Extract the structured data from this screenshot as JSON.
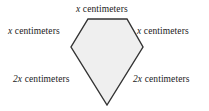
{
  "figure": {
    "shape_name": "pentagon",
    "fill_color": "#efefef",
    "stroke_color": "#333333",
    "background_color": "#ffffff",
    "vertices": [
      {
        "name": "top-left",
        "x": 88,
        "y": 19
      },
      {
        "name": "top-right",
        "x": 127,
        "y": 19
      },
      {
        "name": "right",
        "x": 143,
        "y": 47
      },
      {
        "name": "bottom-apex",
        "x": 107,
        "y": 105
      },
      {
        "name": "left",
        "x": 71,
        "y": 47
      }
    ]
  },
  "labels": {
    "top": {
      "variable": "x",
      "unit": "centimeters"
    },
    "upper_left": {
      "variable": "x",
      "unit": "centimeters"
    },
    "upper_right": {
      "variable": "x",
      "unit": "centimeters"
    },
    "lower_left": {
      "variable": "2x",
      "unit": "centimeters"
    },
    "lower_right": {
      "variable": "2x",
      "unit": "centimeters"
    }
  }
}
